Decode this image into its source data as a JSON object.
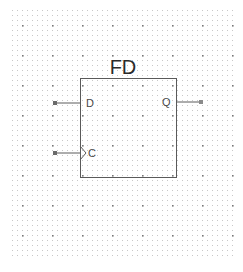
{
  "schematic": {
    "component": {
      "name": "FD",
      "box": {
        "x": 80,
        "y": 78,
        "width": 96,
        "height": 99
      },
      "stroke_color": "#5a5a5a"
    },
    "pins": [
      {
        "id": "D",
        "label": "D",
        "side": "left",
        "y": 103,
        "clock": false
      },
      {
        "id": "C",
        "label": "C",
        "side": "left",
        "y": 153,
        "clock": true
      },
      {
        "id": "Q",
        "label": "Q",
        "side": "right",
        "y": 102,
        "clock": false
      }
    ],
    "grid": {
      "x_start": 12,
      "x_end": 232,
      "y_start": 10,
      "y_end": 258,
      "spacing": 5,
      "major_every": 6,
      "minor_color": "#c8c8c8",
      "major_color": "#777777"
    }
  }
}
